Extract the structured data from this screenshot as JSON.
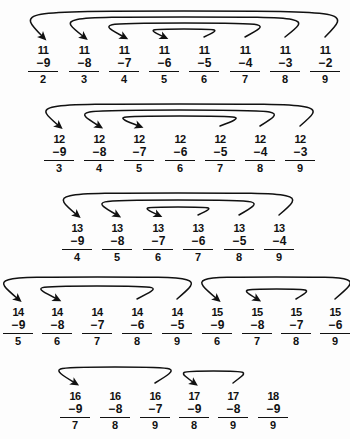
{
  "worksheet": {
    "title": "Subtraction facts practice grid",
    "background_color": "#fdfdfd",
    "ink_color": "#111111",
    "minus_sign": "−",
    "rows": [
      {
        "row_label": "row-1",
        "y_top": 44,
        "problems": [
          {
            "x": 26,
            "minuend": "11",
            "subtrahend": "9",
            "difference": "2"
          },
          {
            "x": 67,
            "minuend": "11",
            "subtrahend": "8",
            "difference": "3"
          },
          {
            "x": 107,
            "minuend": "11",
            "subtrahend": "7",
            "difference": "4"
          },
          {
            "x": 147,
            "minuend": "11",
            "subtrahend": "6",
            "difference": "5"
          },
          {
            "x": 187,
            "minuend": "11",
            "subtrahend": "5",
            "difference": "6"
          },
          {
            "x": 228,
            "minuend": "11",
            "subtrahend": "4",
            "difference": "7"
          },
          {
            "x": 268,
            "minuend": "11",
            "subtrahend": "3",
            "difference": "8"
          },
          {
            "x": 308,
            "minuend": "11",
            "subtrahend": "2",
            "difference": "9"
          }
        ],
        "arcs": [
          {
            "from_index": 7,
            "to_index": 0,
            "height": 30
          },
          {
            "from_index": 6,
            "to_index": 1,
            "height": 24
          },
          {
            "from_index": 5,
            "to_index": 2,
            "height": 18
          },
          {
            "from_index": 4,
            "to_index": 3,
            "height": 12
          }
        ]
      },
      {
        "row_label": "row-2",
        "y_top": 133,
        "problems": [
          {
            "x": 42,
            "minuend": "12",
            "subtrahend": "9",
            "difference": "3"
          },
          {
            "x": 82,
            "minuend": "12",
            "subtrahend": "8",
            "difference": "4"
          },
          {
            "x": 122,
            "minuend": "12",
            "subtrahend": "7",
            "difference": "5"
          },
          {
            "x": 163,
            "minuend": "12",
            "subtrahend": "6",
            "difference": "6"
          },
          {
            "x": 203,
            "minuend": "12",
            "subtrahend": "5",
            "difference": "7"
          },
          {
            "x": 243,
            "minuend": "12",
            "subtrahend": "4",
            "difference": "8"
          },
          {
            "x": 283,
            "minuend": "12",
            "subtrahend": "3",
            "difference": "9"
          }
        ],
        "arcs": [
          {
            "from_index": 6,
            "to_index": 0,
            "height": 26
          },
          {
            "from_index": 5,
            "to_index": 1,
            "height": 20
          },
          {
            "from_index": 4,
            "to_index": 2,
            "height": 14
          }
        ]
      },
      {
        "row_label": "row-3",
        "y_top": 222,
        "problems": [
          {
            "x": 60,
            "minuend": "13",
            "subtrahend": "9",
            "difference": "4"
          },
          {
            "x": 100,
            "minuend": "13",
            "subtrahend": "8",
            "difference": "5"
          },
          {
            "x": 141,
            "minuend": "13",
            "subtrahend": "7",
            "difference": "6"
          },
          {
            "x": 181,
            "minuend": "13",
            "subtrahend": "6",
            "difference": "7"
          },
          {
            "x": 222,
            "minuend": "13",
            "subtrahend": "5",
            "difference": "8"
          },
          {
            "x": 262,
            "minuend": "13",
            "subtrahend": "4",
            "difference": "9"
          }
        ],
        "arcs": [
          {
            "from_index": 5,
            "to_index": 0,
            "height": 26
          },
          {
            "from_index": 4,
            "to_index": 1,
            "height": 19
          },
          {
            "from_index": 3,
            "to_index": 2,
            "height": 12
          }
        ]
      },
      {
        "row_label": "row-4",
        "y_top": 306,
        "problems": [
          {
            "x": 1,
            "minuend": "14",
            "subtrahend": "9",
            "difference": "5"
          },
          {
            "x": 40,
            "minuend": "14",
            "subtrahend": "8",
            "difference": "6"
          },
          {
            "x": 80,
            "minuend": "14",
            "subtrahend": "7",
            "difference": "7"
          },
          {
            "x": 120,
            "minuend": "14",
            "subtrahend": "6",
            "difference": "8"
          },
          {
            "x": 160,
            "minuend": "14",
            "subtrahend": "5",
            "difference": "9"
          },
          {
            "x": 200,
            "minuend": "15",
            "subtrahend": "9",
            "difference": "6"
          },
          {
            "x": 240,
            "minuend": "15",
            "subtrahend": "8",
            "difference": "7"
          },
          {
            "x": 279,
            "minuend": "15",
            "subtrahend": "7",
            "difference": "8"
          },
          {
            "x": 318,
            "minuend": "15",
            "subtrahend": "6",
            "difference": "9"
          }
        ],
        "arcs": [
          {
            "from_index": 4,
            "to_index": 0,
            "height": 26
          },
          {
            "from_index": 3,
            "to_index": 1,
            "height": 17
          },
          {
            "from_index": 8,
            "to_index": 5,
            "height": 26
          },
          {
            "from_index": 7,
            "to_index": 6,
            "height": 14
          }
        ]
      },
      {
        "row_label": "row-5",
        "y_top": 390,
        "problems": [
          {
            "x": 58,
            "minuend": "16",
            "subtrahend": "9",
            "difference": "7"
          },
          {
            "x": 98,
            "minuend": "16",
            "subtrahend": "8",
            "difference": "8"
          },
          {
            "x": 138,
            "minuend": "16",
            "subtrahend": "7",
            "difference": "9"
          },
          {
            "x": 177,
            "minuend": "17",
            "subtrahend": "9",
            "difference": "8"
          },
          {
            "x": 216,
            "minuend": "17",
            "subtrahend": "8",
            "difference": "9"
          },
          {
            "x": 256,
            "minuend": "18",
            "subtrahend": "9",
            "difference": "9"
          }
        ],
        "arcs": [
          {
            "from_index": 2,
            "to_index": 0,
            "height": 20
          },
          {
            "from_index": 4,
            "to_index": 3,
            "height": 16
          }
        ]
      }
    ]
  }
}
